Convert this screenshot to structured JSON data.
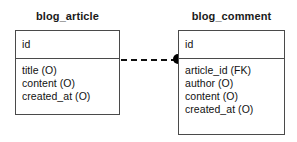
{
  "diagram": {
    "type": "entity-relationship-diagram",
    "background_color": "#ffffff",
    "line_color": "#4a4a4a",
    "text_color": "#111111",
    "entities": [
      {
        "name": "blog_article",
        "title": "blog_article",
        "primary_key": "id",
        "fields": [
          "title (O)",
          "content (O)",
          "created_at (O)"
        ]
      },
      {
        "name": "blog_comment",
        "title": "blog_comment",
        "primary_key": "id",
        "fields": [
          "article_id (FK)",
          "author (O)",
          "content (O)",
          "created_at (O)"
        ]
      }
    ],
    "relationship": {
      "from": "blog_article",
      "to": "blog_comment",
      "line_style": "dashed",
      "endpoint_marker": "filled-circle",
      "endpoint_color": "#000000"
    }
  }
}
